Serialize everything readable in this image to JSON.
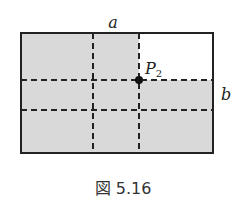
{
  "figure": {
    "caption": "図 5.16",
    "labels": {
      "a": "a",
      "b": "b",
      "point": "P",
      "point_subscript": "2"
    },
    "colors": {
      "shade": "#d9d9d9",
      "line": "#222222",
      "background": "#ffffff"
    }
  }
}
